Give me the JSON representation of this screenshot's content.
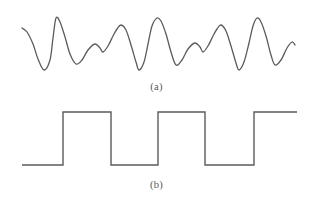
{
  "figure": {
    "background_color": "#ffffff",
    "stroke_color": "#5b5b5d",
    "caption_color": "#58585a",
    "width": 313,
    "height": 202,
    "panels": [
      {
        "id": "a",
        "caption": "(a)",
        "type": "analog-waveform",
        "description": "continuous smooth modulated sinusoidal signal"
      },
      {
        "id": "b",
        "caption": "(b)",
        "type": "digital-waveform",
        "description": "two-level rectangular pulse train (square wave)"
      }
    ]
  },
  "chart_data": [
    {
      "type": "line",
      "title": "(a)",
      "xlabel": "",
      "ylabel": "",
      "xlim": [
        0,
        313
      ],
      "ylim": [
        0,
        101
      ],
      "grid": false,
      "legend": "none",
      "series": [
        {
          "name": "analog-signal",
          "stroke": "#5b5b5d",
          "stroke_width": 1.3,
          "points": [
            [
              22,
              28
            ],
            [
              27,
              32
            ],
            [
              33,
              44
            ],
            [
              38,
              59
            ],
            [
              44,
              70
            ],
            [
              50,
              60
            ],
            [
              53,
              38
            ],
            [
              56,
              18
            ],
            [
              60,
              22
            ],
            [
              65,
              37
            ],
            [
              70,
              54
            ],
            [
              76,
              64
            ],
            [
              82,
              60
            ],
            [
              88,
              50
            ],
            [
              95,
              44
            ],
            [
              100,
              48
            ],
            [
              103,
              52
            ],
            [
              108,
              46
            ],
            [
              113,
              36
            ],
            [
              117,
              29
            ],
            [
              121,
              25
            ],
            [
              126,
              30
            ],
            [
              131,
              45
            ],
            [
              136,
              62
            ],
            [
              139,
              70
            ],
            [
              144,
              62
            ],
            [
              148,
              44
            ],
            [
              152,
              26
            ],
            [
              157,
              18
            ],
            [
              161,
              21
            ],
            [
              166,
              34
            ],
            [
              171,
              52
            ],
            [
              176,
              65
            ],
            [
              182,
              60
            ],
            [
              188,
              49
            ],
            [
              195,
              43
            ],
            [
              200,
              47
            ],
            [
              203,
              52
            ],
            [
              208,
              46
            ],
            [
              213,
              36
            ],
            [
              217,
              29
            ],
            [
              221,
              25
            ],
            [
              226,
              31
            ],
            [
              231,
              46
            ],
            [
              236,
              63
            ],
            [
              239,
              70
            ],
            [
              244,
              62
            ],
            [
              249,
              43
            ],
            [
              253,
              26
            ],
            [
              257,
              18
            ],
            [
              261,
              22
            ],
            [
              266,
              36
            ],
            [
              271,
              55
            ],
            [
              275,
              65
            ],
            [
              281,
              60
            ],
            [
              287,
              48
            ],
            [
              292,
              42
            ],
            [
              295,
              45
            ]
          ]
        }
      ]
    },
    {
      "type": "line",
      "title": "(b)",
      "xlabel": "",
      "ylabel": "",
      "xlim": [
        0,
        313
      ],
      "ylim": [
        0,
        102
      ],
      "grid": false,
      "legend": "none",
      "levels": {
        "low_y": 165,
        "high_y": 112
      },
      "series": [
        {
          "name": "digital-signal",
          "stroke": "#5b5b5d",
          "stroke_width": 1.4,
          "points": [
            [
              22,
              165
            ],
            [
              63,
              165
            ],
            [
              63,
              112
            ],
            [
              111,
              112
            ],
            [
              111,
              165
            ],
            [
              158,
              165
            ],
            [
              158,
              112
            ],
            [
              205,
              112
            ],
            [
              205,
              165
            ],
            [
              254,
              165
            ],
            [
              254,
              112
            ],
            [
              297,
              112
            ]
          ]
        }
      ]
    }
  ]
}
